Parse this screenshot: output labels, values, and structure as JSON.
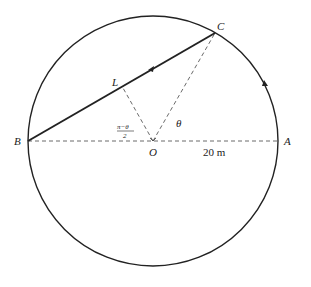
{
  "diagram": {
    "points": {
      "A": "A",
      "B": "B",
      "C": "C",
      "L": "L",
      "O": "O"
    },
    "angle_theta": "θ",
    "angle_half": {
      "numerator": "π−θ",
      "denominator": "2"
    },
    "radius_label": "20 m",
    "colors": {
      "stroke": "#222222",
      "background": "#ffffff"
    }
  }
}
